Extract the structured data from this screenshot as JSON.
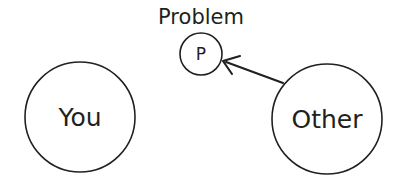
{
  "diagram": {
    "title_visible": false,
    "background_color": "#ffffff",
    "stroke_color": "#231f20",
    "nodes": [
      {
        "id": "you",
        "label": "You",
        "shape": "circle",
        "cx": 80,
        "cy": 117,
        "r": 55,
        "label_font_size": 25
      },
      {
        "id": "problem",
        "label": "P",
        "caption": "Problem",
        "shape": "circle",
        "cx": 201,
        "cy": 54,
        "r": 21,
        "label_font_size": 17,
        "caption_x": 201,
        "caption_y": 24,
        "caption_font_size": 21
      },
      {
        "id": "other",
        "label": "Other",
        "shape": "circle",
        "cx": 327,
        "cy": 119,
        "r": 55,
        "label_font_size": 25
      }
    ],
    "edges": [
      {
        "id": "other-to-problem",
        "from": "other",
        "to": "problem",
        "style": "solid",
        "arrowhead": "open-v",
        "tail_x": 283,
        "tail_y": 83,
        "tip_x": 223,
        "tip_y": 61
      }
    ]
  }
}
